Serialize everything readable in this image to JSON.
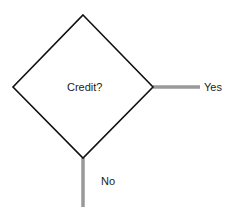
{
  "diagram": {
    "type": "flowchart-decision",
    "decision": {
      "label": "Credit?",
      "shape": "diamond",
      "stroke_color": "#111111",
      "fill_color": "#ffffff",
      "vertices": {
        "top": [
          83,
          15
        ],
        "right": [
          153,
          87
        ],
        "bottom": [
          83,
          158
        ],
        "left": [
          13,
          87
        ]
      }
    },
    "branches": [
      {
        "id": "yes",
        "label": "Yes",
        "direction": "right",
        "line_color": "#999999",
        "from": [
          153,
          87
        ],
        "to": [
          200,
          87
        ]
      },
      {
        "id": "no",
        "label": "No",
        "direction": "down",
        "line_color": "#999999",
        "from": [
          83,
          158
        ],
        "to": [
          83,
          207
        ]
      }
    ]
  }
}
